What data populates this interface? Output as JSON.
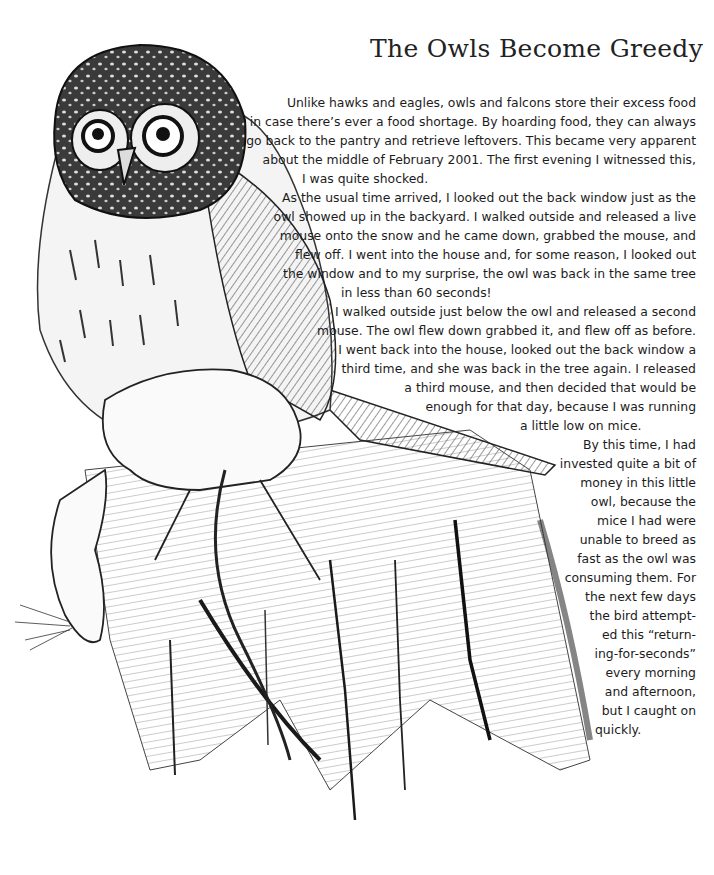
{
  "article": {
    "title": "The Owls Become Greedy",
    "lines": [
      "Unlike hawks and eagles, owls and falcons store their excess food",
      "in case there’s ever a food shortage. By hoarding food, they can always",
      "go back to the pantry and retrieve leftovers. This became very apparent",
      "about the middle of February 2001. The first evening I witnessed this,",
      "I was quite shocked.",
      "As the usual time arrived, I looked out the back window just as the",
      "owl showed up in the backyard. I walked outside and released a live",
      "mouse onto the snow and he came down, grabbed the mouse, and",
      "flew off. I went into the house and, for some reason, I looked out",
      "the window and to my surprise, the owl was back in the same tree",
      "in less than 60 seconds!",
      "I walked outside just below the owl and released a second",
      "mouse. The owl flew down grabbed it, and flew off as before.",
      "I went back into the house, looked out the back window a",
      "third time, and she was back in the tree again. I released",
      "a third mouse, and then decided that would be",
      "enough for that day, because I was running",
      "a little low on mice.",
      "By this time, I had",
      "invested quite a bit of",
      "money in this little",
      "owl, because the",
      "mice I had were",
      "unable to breed as",
      "fast as the owl was",
      "consuming them. For",
      "the next few days",
      "the bird attempt-",
      "ed this “return-",
      "ing-for-seconds”",
      "every morning",
      "and afternoon,",
      "but I caught on",
      "quickly."
    ]
  },
  "illustration": {
    "subject": "pencil drawing of a pygmy owl perched on a tree stump holding a mouse",
    "colors": {
      "ink": "#1a1a1a",
      "mid": "#6b6b6b",
      "light": "#bdbdbd",
      "paper": "#ffffff"
    }
  }
}
